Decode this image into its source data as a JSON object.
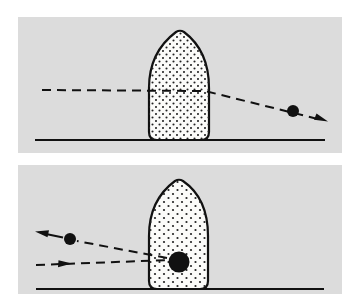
{
  "figure": {
    "colors": {
      "background": "#ffffff",
      "panel": "#dcdcdc",
      "ink": "#111111",
      "target_fill": "#fbfbf9"
    },
    "panels": [
      {
        "id": "top",
        "rect": {
          "x": 18,
          "y": 17,
          "w": 324,
          "h": 136
        },
        "ground": {
          "x1": 35,
          "y1": 140,
          "x2": 325,
          "y2": 140
        },
        "target": {
          "left": 149,
          "right": 209,
          "top": 31,
          "bottom": 140
        },
        "path": [
          [
            42,
            90
          ],
          [
            205,
            91
          ],
          [
            326,
            121
          ]
        ],
        "particles": [
          {
            "cx": 293,
            "cy": 111,
            "r": 6
          }
        ],
        "arrows": [
          {
            "x": 327,
            "y": 121,
            "angle": 14
          }
        ]
      },
      {
        "id": "bottom",
        "rect": {
          "x": 18,
          "y": 165,
          "w": 324,
          "h": 129
        },
        "ground": {
          "x1": 36,
          "y1": 289,
          "x2": 324,
          "y2": 289
        },
        "target": {
          "left": 149,
          "right": 208,
          "top": 179,
          "bottom": 289
        },
        "incoming_path": [
          [
            36,
            265
          ],
          [
            169,
            260
          ]
        ],
        "outgoing_path": [
          [
            167,
            258
          ],
          [
            77,
            241
          ]
        ],
        "particles": [
          {
            "cx": 179,
            "cy": 262,
            "r": 10,
            "role": "nucleus"
          },
          {
            "cx": 70,
            "cy": 239,
            "r": 6,
            "role": "scattered"
          }
        ],
        "arrows": [
          {
            "x": 68,
            "y": 264,
            "angle": -2
          },
          {
            "x": 36,
            "y": 232,
            "angle": 192
          }
        ]
      }
    ]
  }
}
